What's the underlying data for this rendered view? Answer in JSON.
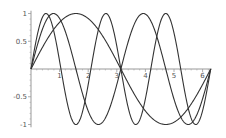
{
  "chart_data": {
    "type": "line",
    "title": "",
    "xlabel": "",
    "ylabel": "",
    "xlim": [
      0,
      6.2832
    ],
    "ylim": [
      -1,
      1
    ],
    "grid": false,
    "legend": null,
    "x_ticks": [
      1,
      2,
      3,
      4,
      5,
      6
    ],
    "x_tick_labels": [
      "1",
      "2",
      "3",
      "4",
      "5",
      "6"
    ],
    "y_ticks": [
      1,
      0.5,
      -0.5,
      -1
    ],
    "y_tick_labels": [
      "1",
      "0.5",
      "-0.5",
      "-1"
    ],
    "series": [
      {
        "name": "sin(x)",
        "frequency": 1
      },
      {
        "name": "sin(2x)",
        "frequency": 2
      },
      {
        "name": "sin(3x)",
        "frequency": 3
      }
    ],
    "line_color": "#333333",
    "axis_color": "#999999"
  },
  "layout": {
    "origin_px": [
      31,
      69
    ],
    "px_per_x_unit": 28.6,
    "px_per_y_unit": 55.5
  }
}
